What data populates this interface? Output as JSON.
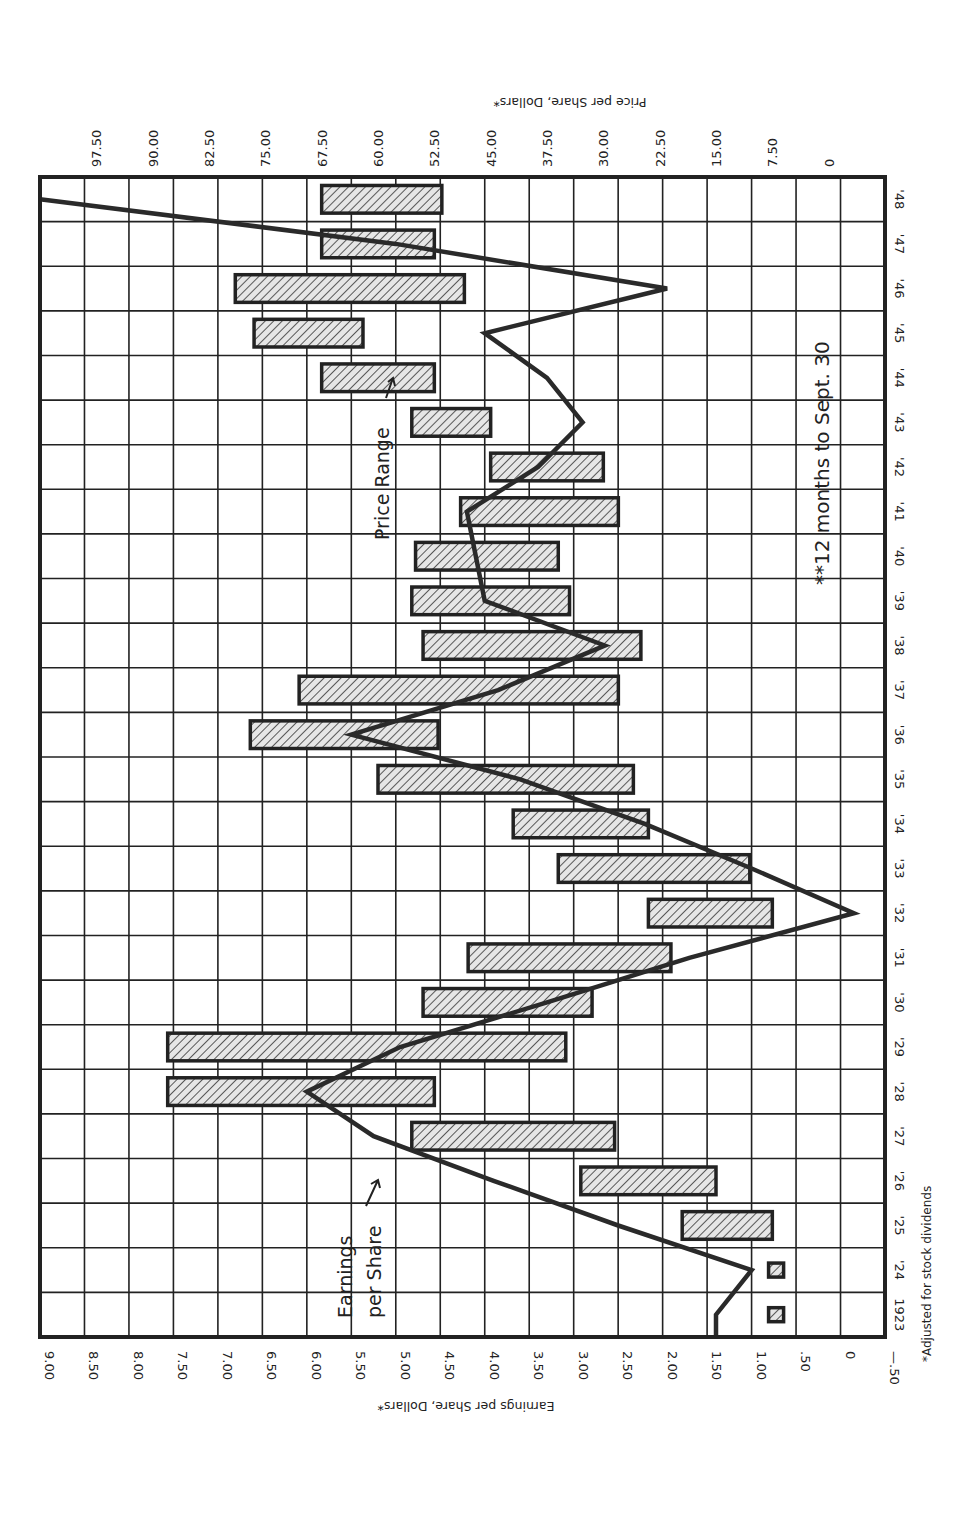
{
  "chart_data": {
    "type": "bar",
    "orientation": "rotated-90",
    "title": "",
    "categories": [
      "1923",
      "'24",
      "'25",
      "'26",
      "'27",
      "'28",
      "'29",
      "'30",
      "'31",
      "'32",
      "'33",
      "'34",
      "'35",
      "'36",
      "'37",
      "'38",
      "'39",
      "'40",
      "'41",
      "'42",
      "'43",
      "'44",
      "'45",
      "'46",
      "'47",
      "'48"
    ],
    "years": [
      1923,
      1924,
      1925,
      1926,
      1927,
      1928,
      1929,
      1930,
      1931,
      1932,
      1933,
      1934,
      1935,
      1936,
      1937,
      1938,
      1939,
      1940,
      1941,
      1942,
      1943,
      1944,
      1945,
      1946,
      1947,
      1948
    ],
    "series": [
      {
        "name": "Earnings per Share",
        "type": "line",
        "axis": "earnings",
        "values": [
          1.4,
          1.0,
          2.5,
          3.9,
          5.25,
          6.0,
          4.95,
          3.3,
          1.7,
          -0.15,
          1.0,
          2.2,
          3.6,
          5.5,
          3.85,
          2.65,
          4.0,
          4.1,
          4.2,
          3.4,
          2.9,
          3.3,
          4.0,
          1.95,
          5.0,
          9.0
        ]
      },
      {
        "name": "Price Range",
        "type": "range-bar",
        "axis": "price",
        "low": [
          6.0,
          6.0,
          7.5,
          15.0,
          28.5,
          52.5,
          35.0,
          31.5,
          21.0,
          7.5,
          10.5,
          24.0,
          26.0,
          52.0,
          28.0,
          25.0,
          34.5,
          36.0,
          28.0,
          30.0,
          45.0,
          52.5,
          62.0,
          48.5,
          52.5,
          51.5
        ],
        "high": [
          8.0,
          8.0,
          19.5,
          33.0,
          55.5,
          88.0,
          88.0,
          54.0,
          48.0,
          24.0,
          36.0,
          42.0,
          60.0,
          77.0,
          70.5,
          54.0,
          55.5,
          55.0,
          49.0,
          45.0,
          55.5,
          67.5,
          76.5,
          79.0,
          67.5,
          67.5
        ]
      }
    ],
    "axes": {
      "earnings": {
        "label": "Earnings per Share, Dollars*",
        "ticks": [
          "9.00",
          "8.50",
          "8.00",
          "7.50",
          "7.00",
          "6.50",
          "6.00",
          "5.50",
          "5.00",
          "4.50",
          "4.00",
          "3.50",
          "3.00",
          "2.50",
          "2.00",
          "1.50",
          "1.00",
          ".50",
          "0",
          "—.50"
        ],
        "range": [
          -0.5,
          9.0
        ]
      },
      "price": {
        "label": "Price per Share, Dollars*",
        "ticks": [
          "97.50",
          "90.00",
          "82.50",
          "75.00",
          "67.50",
          "60.00",
          "52.50",
          "45.00",
          "37.50",
          "30.00",
          "22.50",
          "15.00",
          "7.50",
          "0"
        ],
        "range": [
          -7.5,
          105
        ]
      },
      "year": {
        "ticks": [
          "1923",
          "'24",
          "'25",
          "'26",
          "'27",
          "'28",
          "'29",
          "'30",
          "'31",
          "'32",
          "'33",
          "'34",
          "'35",
          "'36",
          "'37",
          "'38",
          "'39",
          "'40",
          "'41",
          "'42",
          "'43",
          "'44",
          "'45",
          "'46",
          "'47",
          "'48"
        ]
      }
    },
    "grid": true,
    "legend": null,
    "annotations": [
      "Earnings per Share",
      "Price Range",
      "**12 months to Sept. 30"
    ],
    "footnote": "*Adjusted for stock dividends"
  },
  "labels": {
    "earnings_axis_title": "Earnings per Share, Dollars*",
    "price_axis_title": "Price per Share, Dollars*",
    "earnings_annotation_line1": "Earnings",
    "earnings_annotation_line2": "per Share",
    "price_annotation": "Price Range",
    "months_note": "**12 months to Sept. 30",
    "footnote": "*Adjusted for stock dividends"
  },
  "colors": {
    "ink": "#222222",
    "bar_fill": "#dcdcdc",
    "background": "#ffffff"
  }
}
